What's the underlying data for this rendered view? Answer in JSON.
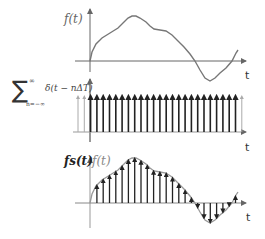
{
  "top_plot": {
    "y_label": "f(t)",
    "x_label": "t",
    "curve_points": "90,61 92,52 96,44 102,38 110,33 118,28 124,22 128,18 132,16 136,16 140,18 146,22 150,26 154,29 160,30 166,31 172,35 178,41 184,47 190,54 195,61 200,70 205,78 210,81 215,78 220,73 226,68 232,61 236,53 238,50",
    "colors": {
      "axis": "#555555",
      "curve": "#777777"
    }
  },
  "middle_plot": {
    "formula_sum_symbol": "∑",
    "formula_sum_upper": "∞",
    "formula_sum_lower": "n=−∞",
    "formula_term": "δ(t − nΔT)",
    "x_label": "t",
    "impulse_start_x": 78,
    "impulse_spacing": 6.3,
    "impulse_count": 27,
    "colors": {
      "impulse": "#222222",
      "impulse_faded": "#aaaaaa",
      "axis": "#888888"
    }
  },
  "bottom_plot": {
    "y_label_sampled": "fs(t)",
    "y_label_original": "f(t)",
    "x_label": "t",
    "colors": {
      "curve": "#999999",
      "impulse": "#222222",
      "axis": "#888888"
    }
  }
}
